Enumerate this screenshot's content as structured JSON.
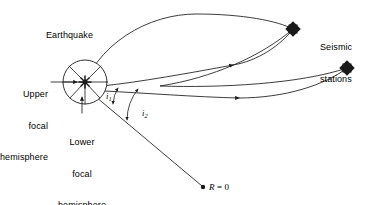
{
  "figure": {
    "background_color": "#ffffff",
    "line_color": "#1a1a1a",
    "width": 367,
    "height": 205
  },
  "labels": {
    "earthquake": "Earthquake",
    "upper_focal_hemisphere_line1": "Upper",
    "upper_focal_hemisphere_line2": "focal",
    "upper_focal_hemisphere_line3": "hemisphere",
    "lower_focal_hemisphere_line1": "Lower",
    "lower_focal_hemisphere_line2": "focal",
    "lower_focal_hemisphere_line3": "hemisphere",
    "seismic_stations_line1": "Seismic",
    "seismic_stations_line2": "stations",
    "angle_i1_base": "i",
    "angle_i1_sub": "1",
    "angle_i2_base": "i",
    "angle_i2_sub": "2",
    "earth_center_R": "R",
    "earth_center_eq": " = 0"
  },
  "markers": {
    "station_1": {
      "name": "seismic-station-1",
      "x": 293,
      "y": 29,
      "shape": "filled-diamond"
    },
    "station_2": {
      "name": "seismic-station-2",
      "x": 347,
      "y": 68,
      "shape": "filled-diamond"
    },
    "earth_center": {
      "name": "earth-center-point",
      "x": 204,
      "y": 188,
      "shape": "filled-dot"
    },
    "hypocenter": {
      "name": "hypocenter-star",
      "x": 85,
      "y": 82,
      "shape": "star-burst"
    }
  },
  "focal_sphere": {
    "cx": 85,
    "cy": 82,
    "r": 22
  },
  "leaders": {
    "upper_hemisphere_arrow": {
      "from_x": 51,
      "from_y": 82,
      "to_x": 76,
      "to_y": 82
    },
    "lower_hemisphere_arrow": {
      "from_x": 82,
      "from_y": 110,
      "to_x": 82,
      "to_y": 96
    }
  },
  "ray_paths": [
    {
      "name": "ray-upper-arc-to-station-1",
      "arrow_at": {
        "x": 232,
        "y": 65
      }
    },
    {
      "name": "ray-direct-to-station-1",
      "arrow_at": {
        "x": 232,
        "y": 65
      }
    },
    {
      "name": "ray-lower-to-station-2",
      "arrow_at": {
        "x": 238,
        "y": 98
      }
    },
    {
      "name": "ray-station1-to-station-2",
      "arrow_at": null
    },
    {
      "name": "ray-downward-to-earth-center",
      "arrow_at": null
    }
  ],
  "angle_arcs": [
    {
      "name": "angle-arc-i1",
      "label": "i1"
    },
    {
      "name": "angle-arc-i2",
      "label": "i2"
    }
  ]
}
